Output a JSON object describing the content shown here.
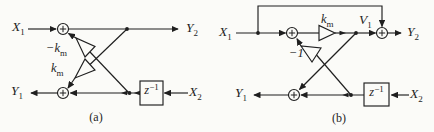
{
  "figure": {
    "colors": {
      "ink": "#1f1f1f",
      "background": "#fbfbf8"
    },
    "panel_a": {
      "caption": "(a)",
      "input_top": {
        "base": "X",
        "sub": "1"
      },
      "output_top": {
        "base": "Y",
        "sub": "2"
      },
      "gain_upper": {
        "base": "−k",
        "sub": "m"
      },
      "gain_lower": {
        "base": "k",
        "sub": "m"
      },
      "output_bottom": {
        "base": "Y",
        "sub": "1"
      },
      "input_bottom": {
        "base": "X",
        "sub": "2"
      },
      "delay": {
        "base": "z",
        "sup": "−1"
      }
    },
    "panel_b": {
      "caption": "(b)",
      "input_top": {
        "base": "X",
        "sub": "1"
      },
      "gain": {
        "base": "k",
        "sub": "m"
      },
      "node_label": {
        "base": "V",
        "sub": "1"
      },
      "output_top": {
        "base": "Y",
        "sub": "2"
      },
      "gain_inverter": "−1",
      "output_bottom": {
        "base": "Y",
        "sub": "1"
      },
      "input_bottom": {
        "base": "X",
        "sub": "2"
      },
      "delay": {
        "base": "z",
        "sup": "−1"
      }
    }
  }
}
